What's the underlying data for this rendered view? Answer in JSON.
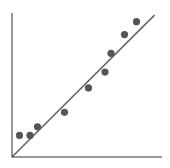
{
  "chart_data": {
    "type": "scatter",
    "title": "",
    "xlabel": "",
    "ylabel": "",
    "xlim": [
      0,
      10
    ],
    "ylim": [
      0,
      10
    ],
    "grid": false,
    "legend": null,
    "series": [
      {
        "name": "points",
        "x": [
          0.5,
          1.2,
          1.7,
          3.5,
          5.1,
          6.2,
          6.6,
          7.5,
          8.3
        ],
        "y": [
          1.5,
          1.5,
          2.1,
          3.1,
          4.8,
          5.9,
          7.2,
          8.5,
          9.4
        ],
        "color": "#555555"
      }
    ],
    "trendline": {
      "x": [
        0,
        9.5
      ],
      "y": [
        0,
        9.85
      ],
      "color": "#666666"
    }
  },
  "colors": {
    "axis": "#333333",
    "point": "#555555",
    "line": "#666666",
    "background": "#ffffff"
  }
}
